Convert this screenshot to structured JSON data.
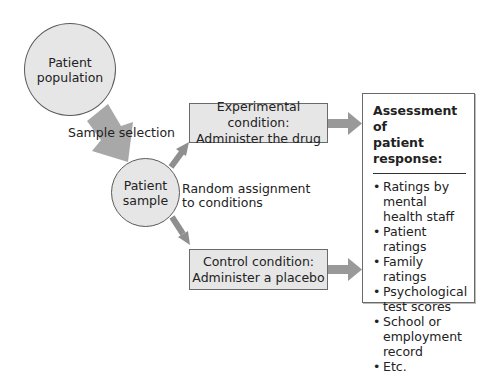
{
  "nodes": {
    "population": {
      "line1": "Patient",
      "line2": "population"
    },
    "sample": {
      "line1": "Patient",
      "line2": "sample"
    },
    "experimental": {
      "line1": "Experimental condition:",
      "line2": "Administer the drug"
    },
    "control": {
      "line1": "Control condition:",
      "line2": "Administer a placebo"
    }
  },
  "edge_labels": {
    "sample_selection": "Sample selection",
    "random_line1": "Random assignment",
    "random_line2": "to conditions"
  },
  "assessment": {
    "title_line1": "Assessment of",
    "title_line2": "patient response:",
    "items": [
      {
        "lines": [
          "Ratings by",
          "mental",
          "health staff"
        ]
      },
      {
        "lines": [
          "Patient ratings"
        ]
      },
      {
        "lines": [
          "Family ratings"
        ]
      },
      {
        "lines": [
          "Psychological",
          "test scores"
        ]
      },
      {
        "lines": [
          "School or",
          "employment",
          "record"
        ]
      },
      {
        "lines": [
          "Etc."
        ]
      }
    ]
  },
  "colors": {
    "node_fill": "#e6e6e6",
    "arrow_fill": "#999999",
    "big_arrow_fill": "#a8a8a8"
  }
}
